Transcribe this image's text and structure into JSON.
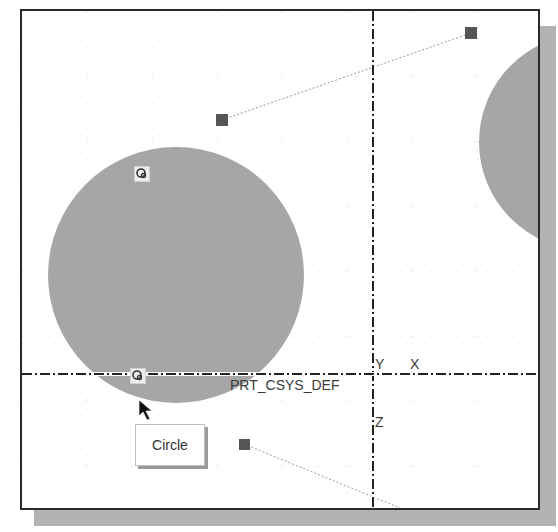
{
  "viewport": {
    "colors": {
      "background": "#ffffff",
      "frame": "#2a2a2a",
      "shadow": "#b3b3b3",
      "circle_fill": "#a6a6a6",
      "handle": "#555555",
      "grid": "#e6e6e6"
    }
  },
  "datum": {
    "csys_label": "PRT_CSYS_DEF",
    "axis_y": "Y",
    "axis_x": "X",
    "axis_z": "Z"
  },
  "sketch": {
    "circles": [
      {
        "name": "main-circle",
        "cx": 174,
        "cy": 273,
        "r": 128
      },
      {
        "name": "right-circle",
        "cx": 585,
        "cy": 140,
        "r": 108
      }
    ],
    "handles": [
      {
        "name": "handle-1",
        "x": 220,
        "y": 118
      },
      {
        "name": "handle-2",
        "x": 469,
        "y": 31
      },
      {
        "name": "handle-3",
        "x": 242,
        "y": 442
      }
    ],
    "snap_icons": [
      {
        "name": "snap-center-icon",
        "x": 140,
        "y": 172
      },
      {
        "name": "snap-tangent-icon",
        "x": 136,
        "y": 374
      }
    ]
  },
  "tooltip": {
    "text": "Circle"
  },
  "cursor": {
    "icon": "arrow-pointer-icon"
  }
}
